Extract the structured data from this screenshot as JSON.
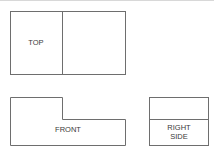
{
  "diagram": {
    "type": "orthographic-projection",
    "cropped_title_fragment": "",
    "stroke_color": "#6e6e6e",
    "text_color": "#3a3a3a",
    "views": [
      {
        "name": "top",
        "label": "TOP"
      },
      {
        "name": "front",
        "label": "FRONT"
      },
      {
        "name": "right-side",
        "label_line1": "RIGHT",
        "label_line2": "SIDE"
      }
    ]
  }
}
